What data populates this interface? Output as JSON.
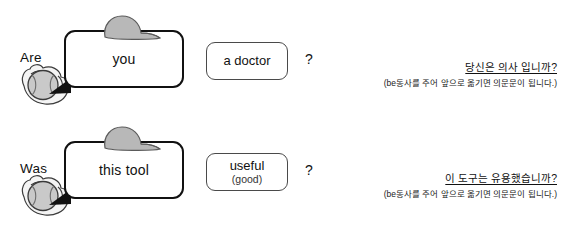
{
  "colors": {
    "bubble_border": "#111111",
    "box_border": "#4a4a4a",
    "cap_fill": "#b8b8b8",
    "ball_fill": "#c9c9c9",
    "glove_fill": "#f2f2f2",
    "text": "#111111",
    "background": "#ffffff"
  },
  "rows": [
    {
      "verb": "Are",
      "subject": "you",
      "complement_main": "a doctor",
      "complement_sub": "",
      "question_mark": "?",
      "korean_heading": "당신은 의사 입니까?",
      "korean_note": "(be동사를 주어 앞으로 옮기면 의문문이 됩니다.)",
      "ball_icon": "baseball-in-glove-icon",
      "cap_icon": "baseball-cap-icon"
    },
    {
      "verb": "Was",
      "subject": "this tool",
      "complement_main": "useful",
      "complement_sub": "(good)",
      "question_mark": "?",
      "korean_heading": "이 도구는 유용했습니까?",
      "korean_note": "(be동사를 주어 앞으로 옮기면 의문문이 됩니다.)",
      "ball_icon": "baseball-in-glove-icon",
      "cap_icon": "baseball-cap-icon"
    }
  ]
}
